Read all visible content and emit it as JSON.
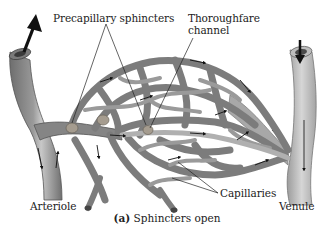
{
  "figure": {
    "caption_letter": "(a)",
    "caption_text": " Sphincters open",
    "colors": {
      "vessel_fill": "#8a8a8a",
      "vessel_dark": "#5f5f5f",
      "vessel_light": "#c4c4c4",
      "venule_fill": "#b9b9b9",
      "sphincter": "#a89f92",
      "arrow": "#111111",
      "leader_line": "#222222",
      "text": "#222222"
    },
    "labels": {
      "precapillary_sphincters": "Precapillary sphincters",
      "thoroughfare_line1": "Thoroughfare",
      "thoroughfare_line2": "channel",
      "capillaries": "Capillaries",
      "arteriole": "Arteriole",
      "venule": "Venule"
    }
  }
}
